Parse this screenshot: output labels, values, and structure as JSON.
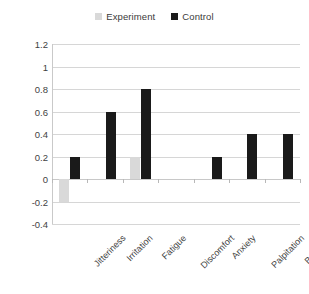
{
  "chart_data": {
    "type": "bar",
    "title": "",
    "xlabel": "",
    "ylabel": "",
    "ylim": [
      -0.4,
      1.2
    ],
    "ystep": 0.2,
    "grid": true,
    "legend_position": "top-center",
    "categories": [
      "Jitteriness",
      "Irritation",
      "Fatigue",
      "Discomfort",
      "Anxiety",
      "Palpitation",
      "Bad odor"
    ],
    "ticks": [
      "1.2",
      "1",
      "0.8",
      "0.6",
      "0.4",
      "0.2",
      "0",
      "-0.2",
      "-0.4"
    ],
    "tick_values": [
      1.2,
      1.0,
      0.8,
      0.6,
      0.4,
      0.2,
      0,
      -0.2,
      -0.4
    ],
    "series": [
      {
        "name": "Experiment",
        "color": "#d9d9d9",
        "values": [
          -0.2,
          0,
          0.2,
          0,
          0,
          0,
          0
        ]
      },
      {
        "name": "Control",
        "color": "#1a1a1a",
        "values": [
          0.2,
          0.6,
          0.8,
          0,
          0.2,
          0.4,
          0.4
        ]
      }
    ]
  },
  "legend": {
    "entries": [
      {
        "label": "Experiment",
        "color": "#d9d9d9"
      },
      {
        "label": "Control",
        "color": "#1a1a1a"
      }
    ]
  }
}
